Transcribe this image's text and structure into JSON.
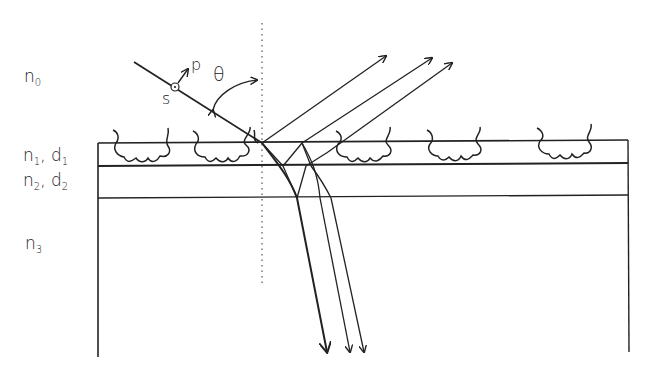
{
  "labels": {
    "n0": {
      "base": "n",
      "sub": "0"
    },
    "n1d1": {
      "base1": "n",
      "sub1": "1",
      "sep": ", ",
      "base2": "d",
      "sub2": "1"
    },
    "n2d2": {
      "base1": "n",
      "sub1": "2",
      "sep": ", ",
      "base2": "d",
      "sub2": "2"
    },
    "n3": {
      "base": "n",
      "sub": "3"
    },
    "theta": "θ",
    "s": "s",
    "p": "p"
  },
  "colors": {
    "line": "#222222",
    "background": "#ffffff"
  }
}
